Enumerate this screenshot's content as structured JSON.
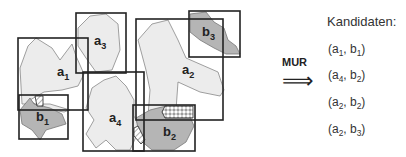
{
  "diagram": {
    "objects_a": [
      "a1",
      "a2",
      "a3",
      "a4"
    ],
    "objects_b": [
      "b1",
      "b2",
      "b3"
    ],
    "labels": {
      "a1": {
        "base": "a",
        "sub": "1"
      },
      "a2": {
        "base": "a",
        "sub": "2"
      },
      "a3": {
        "base": "a",
        "sub": "3"
      },
      "a4": {
        "base": "a",
        "sub": "4"
      },
      "b1": {
        "base": "b",
        "sub": "1"
      },
      "b2": {
        "base": "b",
        "sub": "2"
      },
      "b3": {
        "base": "b",
        "sub": "3"
      }
    },
    "colors": {
      "a_fill": "#ececec",
      "b_fill": "#b5b5b5",
      "stroke": "#222222",
      "outline": "#888888"
    }
  },
  "operation": {
    "label": "MUR",
    "arrow": "⟹"
  },
  "candidates": {
    "title": "Kandidaten:",
    "items": [
      {
        "a": "1",
        "b": "1"
      },
      {
        "a": "4",
        "b": "2"
      },
      {
        "a": "2",
        "b": "2"
      },
      {
        "a": "2",
        "b": "3"
      }
    ]
  }
}
